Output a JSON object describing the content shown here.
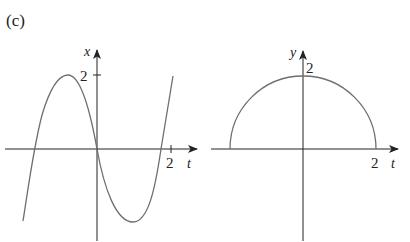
{
  "panel_label": "(c)",
  "left_graph": {
    "vertical_axis_label": "x",
    "horizontal_axis_label": "t",
    "vertical_tick_label": "2",
    "horizontal_tick_label": "2",
    "description": "cubic-like curve x(t) with zeros at t=-2, 0, 2; local max ~2 near t≈-1.2, local min near t≈1.2"
  },
  "right_graph": {
    "vertical_axis_label": "y",
    "horizontal_axis_label": "t",
    "vertical_tick_label": "2",
    "horizontal_tick_label": "2",
    "description": "upper semicircle y(t) of radius 2 centered at origin"
  },
  "colors": {
    "axis": "#222222",
    "curve": "#6e6e6e",
    "background": "#ffffff"
  }
}
